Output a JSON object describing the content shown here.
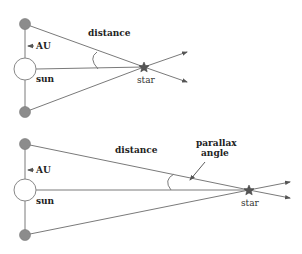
{
  "colors": {
    "line": "#7a7a7a",
    "planet_fill": "#8c8c8c",
    "sun_fill": "#ffffff",
    "star_fill": "#555555",
    "text": "#222222"
  },
  "diagrams": [
    {
      "id": "near-star",
      "labels": {
        "distance": "distance",
        "au": "AU",
        "sun": "sun",
        "star": "star"
      }
    },
    {
      "id": "far-star",
      "labels": {
        "distance": "distance",
        "au": "AU",
        "sun": "sun",
        "star": "star",
        "parallax_line1": "parallax",
        "parallax_line2": "angle"
      }
    }
  ]
}
